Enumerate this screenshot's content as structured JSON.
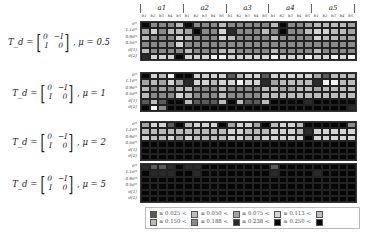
{
  "chart_data": {
    "type": "heatmap",
    "title": "",
    "column_groups": [
      "a1",
      "a2",
      "a3",
      "a4",
      "a5"
    ],
    "column_subgroups": [
      "b1",
      "b2",
      "b3",
      "b4",
      "b5"
    ],
    "row_labels": [
      "σ*",
      "1.1σ*",
      "0.9σ*",
      "0.5σ*",
      "σ(1)",
      "σ(2)"
    ],
    "panels": [
      {
        "label_lhs": "T_d =",
        "matrix": [
          [
            "0",
            "−I"
          ],
          [
            "I",
            "0"
          ]
        ],
        "mu_label": ", μ = 0.5",
        "rows": [
          [
            7,
            4,
            4,
            4,
            2,
            7,
            4,
            4,
            4,
            2,
            4,
            4,
            4,
            4,
            4,
            2,
            7,
            4,
            4,
            3,
            2,
            2,
            2,
            2,
            3
          ],
          [
            3,
            1,
            4,
            2,
            2,
            3,
            7,
            4,
            4,
            1,
            6,
            4,
            4,
            4,
            2,
            4,
            7,
            4,
            4,
            2,
            1,
            1,
            2,
            2,
            3
          ],
          [
            2,
            4,
            4,
            4,
            1,
            2,
            4,
            4,
            4,
            1,
            2,
            4,
            4,
            4,
            4,
            2,
            4,
            4,
            4,
            4,
            1,
            2,
            2,
            3,
            3
          ],
          [
            4,
            4,
            4,
            4,
            1,
            4,
            4,
            4,
            4,
            4,
            4,
            4,
            4,
            4,
            4,
            4,
            4,
            4,
            4,
            4,
            4,
            4,
            4,
            4,
            4
          ],
          [
            2,
            4,
            4,
            4,
            4,
            2,
            4,
            4,
            4,
            2,
            2,
            4,
            4,
            4,
            4,
            2,
            4,
            4,
            4,
            4,
            2,
            4,
            4,
            4,
            4
          ],
          [
            6,
            1,
            1,
            1,
            7,
            1,
            1,
            1,
            0,
            0,
            1,
            1,
            1,
            1,
            1,
            0,
            1,
            1,
            1,
            0,
            1,
            1,
            0,
            1,
            0
          ]
        ]
      },
      {
        "label_lhs": "T_d =",
        "matrix": [
          [
            "0",
            "−I"
          ],
          [
            "I",
            "0"
          ]
        ],
        "mu_label": ", μ = 1",
        "rows": [
          [
            7,
            1,
            2,
            0,
            7,
            7,
            1,
            1,
            1,
            1,
            5,
            2,
            1,
            1,
            5,
            1,
            1,
            1,
            1,
            1,
            3,
            5,
            2,
            2,
            2
          ],
          [
            3,
            2,
            3,
            1,
            3,
            6,
            1,
            1,
            2,
            1,
            1,
            0,
            1,
            1,
            6,
            3,
            2,
            2,
            2,
            2,
            6,
            0,
            0,
            2,
            2
          ],
          [
            2,
            4,
            3,
            4,
            2,
            2,
            4,
            4,
            4,
            2,
            4,
            4,
            4,
            4,
            2,
            2,
            3,
            3,
            2,
            2,
            3,
            2,
            2,
            2,
            2
          ],
          [
            2,
            4,
            4,
            4,
            1,
            2,
            4,
            4,
            4,
            2,
            4,
            4,
            4,
            4,
            2,
            2,
            2,
            2,
            2,
            2,
            2,
            2,
            2,
            2,
            2
          ],
          [
            5,
            2,
            5,
            7,
            7,
            2,
            5,
            5,
            5,
            2,
            7,
            2,
            5,
            5,
            2,
            7,
            7,
            7,
            7,
            6,
            7,
            7,
            7,
            7,
            7
          ],
          [
            7,
            0,
            4,
            7,
            7,
            7,
            7,
            7,
            7,
            7,
            7,
            7,
            7,
            7,
            7,
            7,
            7,
            7,
            7,
            7,
            7,
            7,
            7,
            7,
            6
          ]
        ]
      },
      {
        "label_lhs": "T_d =",
        "matrix": [
          [
            "0",
            "−I"
          ],
          [
            "I",
            "0"
          ]
        ],
        "mu_label": ", μ = 2",
        "rows": [
          [
            3,
            1,
            1,
            5,
            7,
            2,
            1,
            1,
            1,
            7,
            3,
            1,
            1,
            3,
            7,
            2,
            1,
            1,
            2,
            7,
            7,
            7,
            7,
            7,
            4
          ],
          [
            2,
            2,
            2,
            2,
            2,
            2,
            2,
            2,
            2,
            2,
            1,
            1,
            2,
            2,
            2,
            1,
            1,
            1,
            2,
            6,
            1,
            1,
            1,
            1,
            1
          ],
          [
            1,
            2,
            2,
            1,
            3,
            1,
            2,
            2,
            2,
            2,
            1,
            1,
            2,
            2,
            1,
            1,
            1,
            1,
            1,
            7,
            1,
            1,
            1,
            1,
            1
          ],
          [
            7,
            7,
            7,
            7,
            7,
            7,
            7,
            7,
            7,
            7,
            7,
            7,
            7,
            7,
            7,
            7,
            7,
            7,
            7,
            7,
            7,
            7,
            7,
            7,
            7
          ],
          [
            7,
            7,
            7,
            7,
            7,
            7,
            7,
            7,
            7,
            7,
            7,
            7,
            7,
            7,
            7,
            7,
            7,
            7,
            7,
            7,
            7,
            7,
            7,
            7,
            7
          ],
          [
            7,
            7,
            7,
            7,
            7,
            7,
            7,
            7,
            7,
            7,
            7,
            7,
            7,
            7,
            7,
            7,
            7,
            7,
            7,
            7,
            7,
            7,
            7,
            7,
            7
          ]
        ]
      },
      {
        "label_lhs": "T_d =",
        "matrix": [
          [
            "0",
            "−I"
          ],
          [
            "I",
            "0"
          ]
        ],
        "mu_label": ", μ = 5",
        "rows": [
          [
            6,
            5,
            5,
            6,
            7,
            6,
            6,
            7,
            7,
            7,
            7,
            7,
            7,
            7,
            7,
            5,
            7,
            7,
            7,
            7,
            7,
            7,
            7,
            7,
            7
          ],
          [
            7,
            6,
            6,
            6,
            7,
            7,
            6,
            7,
            7,
            7,
            7,
            7,
            7,
            7,
            7,
            6,
            7,
            7,
            7,
            7,
            6,
            7,
            7,
            7,
            7
          ],
          [
            7,
            7,
            7,
            7,
            7,
            7,
            7,
            7,
            7,
            7,
            7,
            7,
            7,
            7,
            7,
            7,
            7,
            7,
            7,
            7,
            7,
            7,
            7,
            7,
            7
          ],
          [
            7,
            7,
            7,
            7,
            7,
            7,
            7,
            7,
            7,
            7,
            7,
            7,
            7,
            7,
            7,
            7,
            7,
            7,
            7,
            7,
            7,
            7,
            7,
            7,
            7
          ],
          [
            7,
            7,
            7,
            7,
            7,
            7,
            7,
            7,
            7,
            7,
            7,
            7,
            7,
            7,
            7,
            7,
            7,
            7,
            7,
            7,
            7,
            7,
            7,
            7,
            7
          ],
          [
            7,
            7,
            7,
            7,
            7,
            7,
            7,
            7,
            7,
            7,
            7,
            7,
            7,
            7,
            7,
            7,
            7,
            7,
            7,
            7,
            7,
            7,
            7,
            7,
            7
          ]
        ]
      }
    ],
    "legend": {
      "thresholds": [
        "≤ 0.025 <",
        "≤ 0.050 <",
        "≤ 0.075 <",
        "≤ 0.113 <",
        "≤ 0.150 <",
        "≤ 0.188 <",
        "≤ 0.238 <",
        "≤ 0.250 <"
      ],
      "colors": [
        "#f2f2f2",
        "#d6d6d6",
        "#bdbdbd",
        "#9e9e9e",
        "#6e6e6e",
        "#4a4a4a",
        "#262626",
        "#050505"
      ],
      "line1": [
        {
          "swatch": 5,
          "text": "≤ 0.025 <"
        },
        {
          "swatch": 2,
          "text": "≤ 0.050 <"
        },
        {
          "swatch": 3,
          "text": "≤ 0.075 <"
        },
        {
          "swatch": 1,
          "text": "≤ 0.113 <"
        },
        {
          "swatch": 2,
          "text": ""
        }
      ],
      "line2": [
        {
          "swatch": 2,
          "text": "≤ 0.150 <"
        },
        {
          "swatch": 4,
          "text": "≤ 0.188 <"
        },
        {
          "swatch": 6,
          "text": "≤ 0.238 <"
        },
        {
          "swatch": 7,
          "text": "≤ 0.250 <"
        },
        {
          "swatch": 7,
          "text": ""
        }
      ]
    }
  }
}
